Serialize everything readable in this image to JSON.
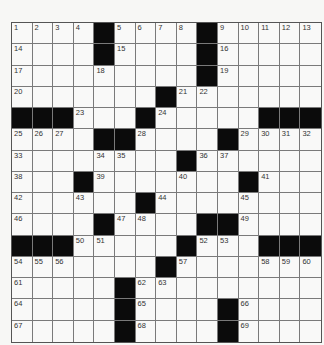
{
  "puzzle": {
    "rows": 15,
    "cols": 15,
    "layout": [
      "....#....#.....",
      "....#....#.....",
      ".........#.....",
      ".......#.......",
      "###...#.....###",
      "....##....#....",
      "........#......",
      "...#.......#...",
      "......#........",
      "....#....##....",
      "###.....#...###",
      ".......#.......",
      ".....#.........",
      ".....#....#....",
      ".....#....#...."
    ],
    "numbers": {
      "0,0": "1",
      "0,1": "2",
      "0,2": "3",
      "0,3": "4",
      "0,5": "5",
      "0,6": "6",
      "0,7": "7",
      "0,8": "8",
      "0,10": "9",
      "0,11": "10",
      "0,12": "11",
      "0,13": "12",
      "0,14": "13",
      "1,0": "14",
      "1,5": "15",
      "1,10": "16",
      "2,0": "17",
      "2,4": "18",
      "2,10": "19",
      "3,0": "20",
      "3,8": "21",
      "3,9": "22",
      "4,3": "23",
      "4,7": "24",
      "5,0": "25",
      "5,1": "26",
      "5,2": "27",
      "5,6": "28",
      "5,11": "29",
      "5,12": "30",
      "5,13": "31",
      "5,14": "32",
      "6,0": "33",
      "6,4": "34",
      "6,5": "35",
      "6,9": "36",
      "6,10": "37",
      "7,0": "38",
      "7,4": "39",
      "7,8": "40",
      "7,12": "41",
      "8,0": "42",
      "8,3": "43",
      "8,7": "44",
      "8,11": "45",
      "9,0": "46",
      "9,5": "47",
      "9,6": "48",
      "9,11": "49",
      "10,3": "50",
      "10,4": "51",
      "10,9": "52",
      "10,10": "53",
      "11,0": "54",
      "11,1": "55",
      "11,2": "56",
      "11,8": "57",
      "11,12": "58",
      "11,13": "59",
      "11,14": "60",
      "12,0": "61",
      "12,6": "62",
      "12,7": "63",
      "13,0": "64",
      "13,6": "65",
      "13,11": "66",
      "14,0": "67",
      "14,6": "68",
      "14,11": "69"
    }
  }
}
